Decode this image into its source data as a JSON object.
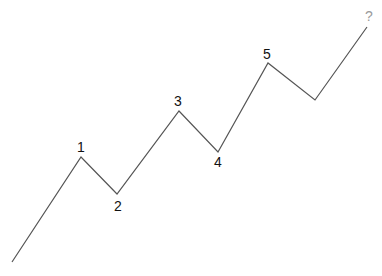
{
  "diagram": {
    "line_color": "#555555",
    "label_color": "#111111",
    "unknown_label_color": "#9a9a9a",
    "points": [
      {
        "x": 12,
        "y": 262,
        "label": ""
      },
      {
        "x": 81,
        "y": 157,
        "label": "1",
        "label_x": 81,
        "label_y": 152
      },
      {
        "x": 117,
        "y": 194,
        "label": "2",
        "label_x": 118,
        "label_y": 211
      },
      {
        "x": 179,
        "y": 111,
        "label": "3",
        "label_x": 178,
        "label_y": 106
      },
      {
        "x": 218,
        "y": 152,
        "label": "4",
        "label_x": 218,
        "label_y": 167
      },
      {
        "x": 268,
        "y": 63,
        "label": "5",
        "label_x": 267,
        "label_y": 59
      },
      {
        "x": 315,
        "y": 100,
        "label": ""
      },
      {
        "x": 367,
        "y": 27,
        "label": "?",
        "label_x": 369,
        "label_y": 21
      }
    ],
    "labels": {
      "w1": "1",
      "w2": "2",
      "w3": "3",
      "w4": "4",
      "w5": "5",
      "next": "?"
    }
  }
}
